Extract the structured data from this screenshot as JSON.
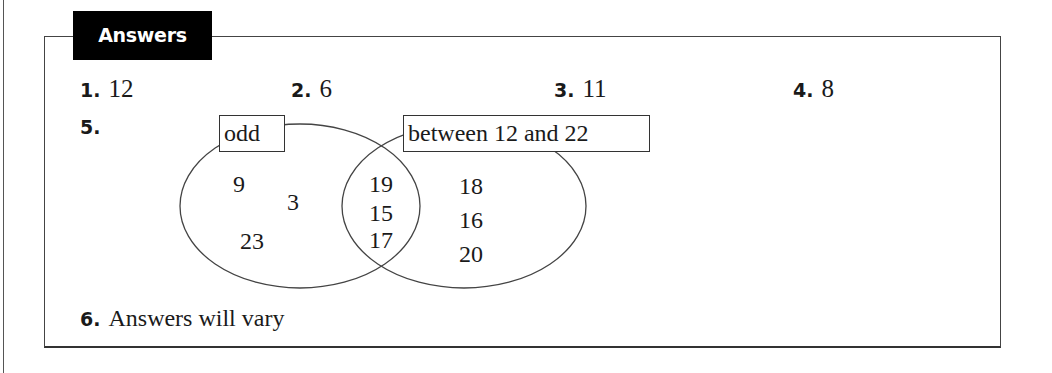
{
  "header": {
    "title": "Answers"
  },
  "answers": [
    {
      "number": "1.",
      "value": "12"
    },
    {
      "number": "2.",
      "value": "6"
    },
    {
      "number": "3.",
      "value": "11"
    },
    {
      "number": "4.",
      "value": "8"
    },
    {
      "number": "5.",
      "value": ""
    },
    {
      "number": "6.",
      "value": "Answers will vary"
    }
  ],
  "venn": {
    "left_label": "odd",
    "right_label": "between 12 and 22",
    "left_only": [
      "9",
      "3",
      "23"
    ],
    "intersection": [
      "19",
      "15",
      "17"
    ],
    "right_only": [
      "18",
      "16",
      "20"
    ]
  }
}
